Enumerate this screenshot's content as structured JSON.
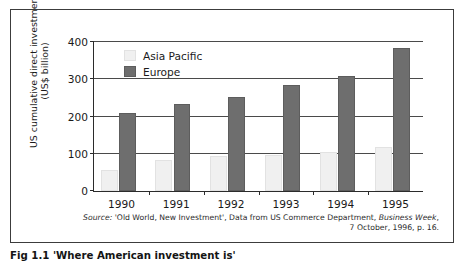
{
  "figure": {
    "caption": "Fig 1.1  'Where American investment is' "
  },
  "chart_data": {
    "type": "bar",
    "title": "",
    "xlabel": "",
    "ylabel": "US cumulative direct investment (US$ billion)",
    "ylabel_line1": "US cumulative direct investment",
    "ylabel_line2": "(US$ billion)",
    "categories": [
      "1990",
      "1991",
      "1992",
      "1993",
      "1994",
      "1995"
    ],
    "ylim": [
      0,
      400
    ],
    "yticks": [
      0,
      100,
      200,
      300,
      400
    ],
    "ytick_labels": [
      "0",
      "100",
      "200",
      "300",
      "400"
    ],
    "grid": true,
    "legend_position": "top-left",
    "series": [
      {
        "name": "Asia Pacific",
        "color": "#f0f0f0",
        "values": [
          56,
          84,
          95,
          96,
          106,
          118
        ]
      },
      {
        "name": "Europe",
        "color": "#6e6e6e",
        "values": [
          210,
          234,
          253,
          285,
          310,
          385
        ]
      }
    ]
  },
  "source": {
    "label": "Source:",
    "line1_rest": " 'Old World, New Investment', Data from US Commerce Department, ",
    "italic_title": "Business Week",
    "line1_tail": ",",
    "line2": "7 October, 1996, p. 16."
  }
}
